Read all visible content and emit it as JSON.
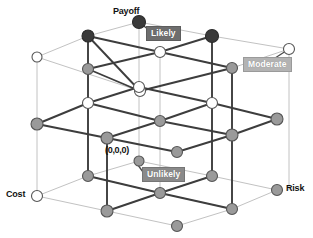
{
  "figure": {
    "type": "3d-lattice-cube-diagram",
    "background": "#ffffff"
  },
  "axes": {
    "payoff": {
      "label": "Payoff",
      "x": 113,
      "y": 8
    },
    "cost": {
      "label": "Cost",
      "x": 6,
      "y": 190
    },
    "risk": {
      "label": "Risk",
      "x": 283,
      "y": 184
    }
  },
  "origin": {
    "label": "(0,0,0)",
    "x": 105,
    "y": 148
  },
  "callouts": [
    {
      "name": "likely",
      "label": "Likely",
      "x": 144,
      "y": 25,
      "anchor_x": 139,
      "anchor_y": 22,
      "style": "dark"
    },
    {
      "name": "moderate",
      "label": "Moderate",
      "x": 243,
      "y": 56,
      "anchor_x": 289,
      "anchor_y": 49,
      "style": "light"
    },
    {
      "name": "unlikely",
      "label": "Unlikely",
      "x": 141,
      "y": 166,
      "anchor_x": 135,
      "anchor_y": 161,
      "style": "mid"
    }
  ],
  "colors": {
    "node_dark": "#3a3a3a",
    "node_mid": "#9a9a9a",
    "node_light": "#ffffff",
    "node_stroke": "#555555",
    "edge_strong": "#3d3d3d",
    "edge_faint": "#c2c2c2",
    "text": "#111111"
  },
  "legend_values": {
    "likelihood_levels": [
      "Unlikely",
      "Moderate",
      "Likely"
    ],
    "dimensions": [
      "Cost",
      "Risk",
      "Payoff"
    ],
    "grid_size": "3 x 3 x 3",
    "origin_coordinate": "(0,0,0)"
  },
  "nodes": [
    {
      "id": "t-back-left",
      "x": 37,
      "y": 57,
      "fill": "light",
      "r": 5
    },
    {
      "id": "t-back-mid",
      "x": 88,
      "y": 36,
      "fill": "dark",
      "r": 6
    },
    {
      "id": "t-back-right",
      "x": 139,
      "y": 22,
      "fill": "dark",
      "r": 6.5
    },
    {
      "id": "t-mid-left",
      "x": 88,
      "y": 69,
      "fill": "mid",
      "r": 5.5
    },
    {
      "id": "t-mid-mid",
      "x": 160,
      "y": 52,
      "fill": "light",
      "r": 5.5
    },
    {
      "id": "t-mid-right",
      "x": 212,
      "y": 36,
      "fill": "dark",
      "r": 6.5
    },
    {
      "id": "t-front-left",
      "x": 140,
      "y": 91,
      "fill": "light",
      "r": 5.5
    },
    {
      "id": "t-front-mid",
      "x": 232,
      "y": 68,
      "fill": "mid",
      "r": 5.5
    },
    {
      "id": "t-front-right",
      "x": 289,
      "y": 49,
      "fill": "light",
      "r": 5.5
    },
    {
      "id": "m-back-left",
      "x": 37,
      "y": 124,
      "fill": "mid",
      "r": 6
    },
    {
      "id": "m-back-mid",
      "x": 88,
      "y": 103,
      "fill": "light",
      "r": 5.5
    },
    {
      "id": "m-back-right",
      "x": 139,
      "y": 87,
      "fill": "light",
      "r": 5.5
    },
    {
      "id": "m-mid-left",
      "x": 107,
      "y": 138,
      "fill": "mid",
      "r": 6
    },
    {
      "id": "m-center",
      "x": 160,
      "y": 121,
      "fill": "mid",
      "r": 5.5
    },
    {
      "id": "m-mid-right",
      "x": 212,
      "y": 103,
      "fill": "light",
      "r": 5.5
    },
    {
      "id": "m-front-left",
      "x": 177,
      "y": 152,
      "fill": "mid",
      "r": 5.5
    },
    {
      "id": "m-front-mid",
      "x": 232,
      "y": 135,
      "fill": "mid",
      "r": 6
    },
    {
      "id": "m-front-right",
      "x": 277,
      "y": 119,
      "fill": "mid",
      "r": 6
    },
    {
      "id": "b-back-left",
      "x": 37,
      "y": 196,
      "fill": "light",
      "r": 5.5
    },
    {
      "id": "b-back-mid",
      "x": 88,
      "y": 176,
      "fill": "mid",
      "r": 5.5
    },
    {
      "id": "b-back-right",
      "x": 139,
      "y": 161,
      "fill": "mid",
      "r": 5
    },
    {
      "id": "b-mid-left",
      "x": 107,
      "y": 211,
      "fill": "mid",
      "r": 6
    },
    {
      "id": "b-center",
      "x": 160,
      "y": 193,
      "fill": "mid",
      "r": 5.5
    },
    {
      "id": "b-mid-right",
      "x": 212,
      "y": 176,
      "fill": "mid",
      "r": 5.5
    },
    {
      "id": "b-front-left",
      "x": 177,
      "y": 226,
      "fill": "mid",
      "r": 5.5
    },
    {
      "id": "b-front-mid",
      "x": 232,
      "y": 209,
      "fill": "mid",
      "r": 5.5
    },
    {
      "id": "b-front-right",
      "x": 277,
      "y": 190,
      "fill": "mid",
      "r": 5.5
    }
  ]
}
